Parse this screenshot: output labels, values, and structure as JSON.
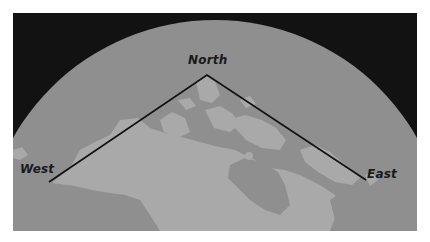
{
  "map": {
    "labels": {
      "north": "North",
      "west": "West",
      "east": "East"
    },
    "colors": {
      "space": "#121212",
      "ocean": "#8f8f8f",
      "land": "#a9a9a9",
      "line": "#111111",
      "background": "#ffffff"
    }
  }
}
